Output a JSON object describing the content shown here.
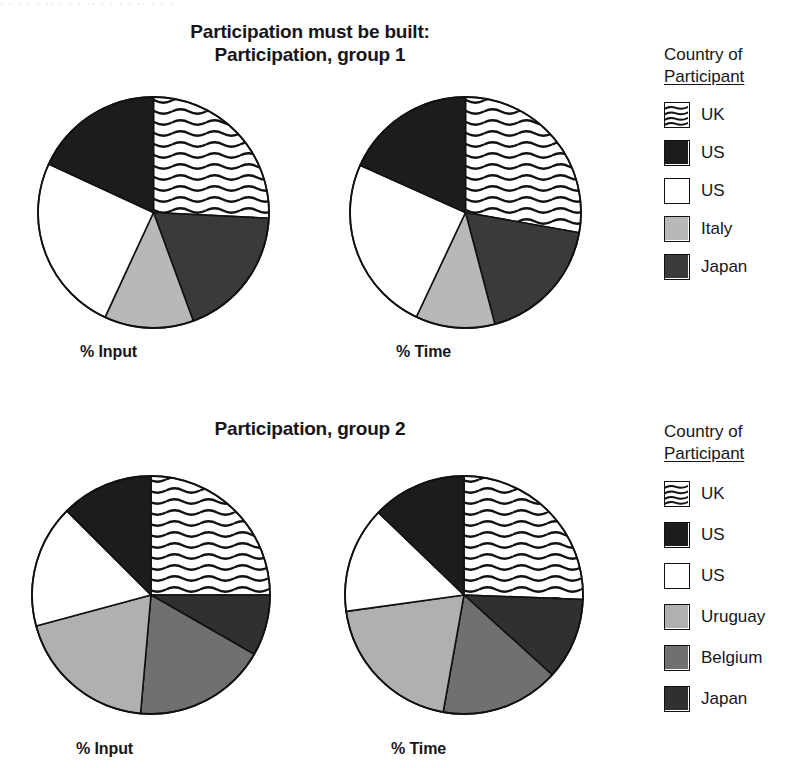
{
  "scan_artifact": "· ·  ·   · ·  ·· · ·   ·  ·· ·   · ·  ·    ·· ·   · ·",
  "titles": {
    "group1": "Participation must be built:\nParticipation, group 1",
    "group1_line1": "Participation must be built:",
    "group1_line2": "Participation, group 1",
    "group2": "Participation, group 2"
  },
  "axis_labels": {
    "input": "% Input",
    "time": "% Time"
  },
  "legends": [
    {
      "title_line1": "Country of",
      "title_line2": "Participant",
      "items": [
        {
          "label": "UK",
          "fill": "wavy",
          "color": "#ffffff"
        },
        {
          "label": "US",
          "fill": "solid",
          "color": "#1c1c1c"
        },
        {
          "label": "US",
          "fill": "solid",
          "color": "#ffffff"
        },
        {
          "label": "Italy",
          "fill": "solid",
          "color": "#b8b8b8"
        },
        {
          "label": "Japan",
          "fill": "solid",
          "color": "#3a3a3a"
        }
      ]
    },
    {
      "title_line1": "Country of",
      "title_line2": "Participant",
      "items": [
        {
          "label": "UK",
          "fill": "wavy",
          "color": "#ffffff"
        },
        {
          "label": "US",
          "fill": "solid",
          "color": "#1c1c1c"
        },
        {
          "label": "US",
          "fill": "solid",
          "color": "#ffffff"
        },
        {
          "label": "Uruguay",
          "fill": "solid",
          "color": "#b0b0b0"
        },
        {
          "label": "Belgium",
          "fill": "solid",
          "color": "#707070"
        },
        {
          "label": "Japan",
          "fill": "solid",
          "color": "#303030"
        }
      ]
    }
  ],
  "chart_data": [
    {
      "type": "pie",
      "title": "Participation, group 1 — % Input",
      "id": "pie-g1-input",
      "group": "group 1",
      "measure": "% Input",
      "start_angle_deg": 0,
      "direction": "clockwise",
      "categories": [
        "UK",
        "Japan",
        "Italy",
        "US",
        "US"
      ],
      "values": [
        25.8,
        18.6,
        12.5,
        25.0,
        18.1
      ],
      "slices": [
        {
          "label": "UK",
          "value": 25.8,
          "fill": "wavy",
          "color": "#ffffff"
        },
        {
          "label": "Japan",
          "value": 18.6,
          "fill": "solid",
          "color": "#3a3a3a"
        },
        {
          "label": "Italy",
          "value": 12.5,
          "fill": "solid",
          "color": "#b8b8b8"
        },
        {
          "label": "US",
          "value": 25.0,
          "fill": "solid",
          "color": "#ffffff"
        },
        {
          "label": "US",
          "value": 18.1,
          "fill": "solid",
          "color": "#1c1c1c"
        }
      ]
    },
    {
      "type": "pie",
      "title": "Participation, group 1 — % Time",
      "id": "pie-g1-time",
      "group": "group 1",
      "measure": "% Time",
      "start_angle_deg": 0,
      "direction": "clockwise",
      "categories": [
        "UK",
        "Japan",
        "Italy",
        "US",
        "US"
      ],
      "values": [
        27.8,
        18.1,
        11.1,
        24.7,
        18.3
      ],
      "slices": [
        {
          "label": "UK",
          "value": 27.8,
          "fill": "wavy",
          "color": "#ffffff"
        },
        {
          "label": "Japan",
          "value": 18.1,
          "fill": "solid",
          "color": "#3a3a3a"
        },
        {
          "label": "Italy",
          "value": 11.1,
          "fill": "solid",
          "color": "#b8b8b8"
        },
        {
          "label": "US",
          "value": 24.7,
          "fill": "solid",
          "color": "#ffffff"
        },
        {
          "label": "US",
          "value": 18.3,
          "fill": "solid",
          "color": "#1c1c1c"
        }
      ]
    },
    {
      "type": "pie",
      "title": "Participation, group 2 — % Input",
      "id": "pie-g2-input",
      "group": "group 2",
      "measure": "% Input",
      "start_angle_deg": 0,
      "direction": "clockwise",
      "categories": [
        "UK",
        "Japan",
        "Belgium",
        "Uruguay",
        "US",
        "US"
      ],
      "values": [
        25.0,
        8.3,
        18.1,
        19.4,
        16.7,
        12.5
      ],
      "slices": [
        {
          "label": "UK",
          "value": 25.0,
          "fill": "wavy",
          "color": "#ffffff"
        },
        {
          "label": "Japan",
          "value": 8.3,
          "fill": "solid",
          "color": "#303030"
        },
        {
          "label": "Belgium",
          "value": 18.1,
          "fill": "solid",
          "color": "#707070"
        },
        {
          "label": "Uruguay",
          "value": 19.4,
          "fill": "solid",
          "color": "#b0b0b0"
        },
        {
          "label": "US",
          "value": 16.7,
          "fill": "solid",
          "color": "#ffffff"
        },
        {
          "label": "US",
          "value": 12.5,
          "fill": "solid",
          "color": "#1c1c1c"
        }
      ]
    },
    {
      "type": "pie",
      "title": "Participation, group 2 — % Time",
      "id": "pie-g2-time",
      "group": "group 2",
      "measure": "% Time",
      "start_angle_deg": 0,
      "direction": "clockwise",
      "categories": [
        "UK",
        "Japan",
        "Belgium",
        "Uruguay",
        "US",
        "US"
      ],
      "values": [
        25.6,
        11.1,
        16.1,
        20.0,
        14.4,
        12.8
      ],
      "slices": [
        {
          "label": "UK",
          "value": 25.6,
          "fill": "wavy",
          "color": "#ffffff"
        },
        {
          "label": "Japan",
          "value": 11.1,
          "fill": "solid",
          "color": "#303030"
        },
        {
          "label": "Belgium",
          "value": 16.1,
          "fill": "solid",
          "color": "#707070"
        },
        {
          "label": "Uruguay",
          "value": 20.0,
          "fill": "solid",
          "color": "#b0b0b0"
        },
        {
          "label": "US",
          "value": 14.4,
          "fill": "solid",
          "color": "#ffffff"
        },
        {
          "label": "US",
          "value": 12.8,
          "fill": "solid",
          "color": "#1c1c1c"
        }
      ]
    }
  ]
}
